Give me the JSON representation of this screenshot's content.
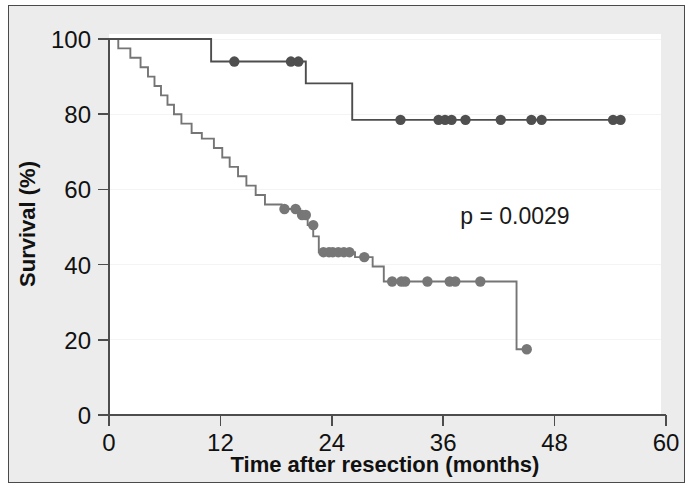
{
  "figure": {
    "background_color": "#ececec",
    "plot_background_color": "#ffffff",
    "border_color": "#4a4a4a"
  },
  "annotations": {
    "pvalue": "p = 0.0029"
  },
  "axis": {
    "x_title": "Time after resection (months)",
    "y_title": "Survival (%)",
    "x_ticks": [
      "0",
      "12",
      "24",
      "36",
      "48",
      "60"
    ],
    "y_ticks": [
      "0",
      "20",
      "40",
      "60",
      "80",
      "100"
    ]
  },
  "chart_data": {
    "type": "line",
    "subtype": "kaplan-meier-survival",
    "title": "",
    "xlabel": "Time after resection (months)",
    "ylabel": "Survival (%)",
    "xlim": [
      0,
      60
    ],
    "ylim": [
      0,
      100
    ],
    "xticks": [
      0,
      12,
      24,
      36,
      48,
      60
    ],
    "yticks": [
      0,
      20,
      40,
      60,
      80,
      100
    ],
    "grid": true,
    "legend": "none",
    "annotations": [
      {
        "text": "p = 0.0029",
        "x": 41.5,
        "y": 54
      }
    ],
    "series": [
      {
        "name": "upper-curve",
        "color": "#4d4d4d",
        "steps": [
          {
            "x": 0.0,
            "y": 100.0
          },
          {
            "x": 11.0,
            "y": 100.0
          },
          {
            "x": 11.0,
            "y": 94.0
          },
          {
            "x": 21.2,
            "y": 94.0
          },
          {
            "x": 21.2,
            "y": 88.2
          },
          {
            "x": 26.2,
            "y": 88.2
          },
          {
            "x": 26.2,
            "y": 78.5
          },
          {
            "x": 55.2,
            "y": 78.5
          }
        ],
        "censored": [
          {
            "x": 13.5,
            "y": 94.0
          },
          {
            "x": 19.6,
            "y": 94.0
          },
          {
            "x": 20.4,
            "y": 94.0
          },
          {
            "x": 31.4,
            "y": 78.5
          },
          {
            "x": 35.5,
            "y": 78.5
          },
          {
            "x": 36.2,
            "y": 78.5
          },
          {
            "x": 36.9,
            "y": 78.5
          },
          {
            "x": 38.4,
            "y": 78.5
          },
          {
            "x": 42.2,
            "y": 78.5
          },
          {
            "x": 45.5,
            "y": 78.5
          },
          {
            "x": 46.6,
            "y": 78.5
          },
          {
            "x": 54.3,
            "y": 78.5
          },
          {
            "x": 55.1,
            "y": 78.5
          }
        ]
      },
      {
        "name": "lower-curve",
        "color": "#757575",
        "steps": [
          {
            "x": 0.0,
            "y": 100.0
          },
          {
            "x": 1.0,
            "y": 100.0
          },
          {
            "x": 1.0,
            "y": 97.5
          },
          {
            "x": 2.3,
            "y": 97.5
          },
          {
            "x": 2.3,
            "y": 95.0
          },
          {
            "x": 3.4,
            "y": 95.0
          },
          {
            "x": 3.4,
            "y": 92.5
          },
          {
            "x": 4.2,
            "y": 92.5
          },
          {
            "x": 4.2,
            "y": 90.0
          },
          {
            "x": 4.9,
            "y": 90.0
          },
          {
            "x": 4.9,
            "y": 87.5
          },
          {
            "x": 5.6,
            "y": 87.5
          },
          {
            "x": 5.6,
            "y": 85.0
          },
          {
            "x": 6.3,
            "y": 85.0
          },
          {
            "x": 6.3,
            "y": 82.5
          },
          {
            "x": 7.0,
            "y": 82.5
          },
          {
            "x": 7.0,
            "y": 80.0
          },
          {
            "x": 7.8,
            "y": 80.0
          },
          {
            "x": 7.8,
            "y": 77.5
          },
          {
            "x": 8.9,
            "y": 77.5
          },
          {
            "x": 8.9,
            "y": 75.0
          },
          {
            "x": 10.0,
            "y": 75.0
          },
          {
            "x": 10.0,
            "y": 73.5
          },
          {
            "x": 11.3,
            "y": 73.5
          },
          {
            "x": 11.3,
            "y": 71.0
          },
          {
            "x": 12.2,
            "y": 71.0
          },
          {
            "x": 12.2,
            "y": 68.5
          },
          {
            "x": 13.0,
            "y": 68.5
          },
          {
            "x": 13.0,
            "y": 66.0
          },
          {
            "x": 13.9,
            "y": 66.0
          },
          {
            "x": 13.9,
            "y": 63.5
          },
          {
            "x": 14.8,
            "y": 63.5
          },
          {
            "x": 14.8,
            "y": 61.0
          },
          {
            "x": 15.8,
            "y": 61.0
          },
          {
            "x": 15.8,
            "y": 58.5
          },
          {
            "x": 16.8,
            "y": 58.5
          },
          {
            "x": 16.8,
            "y": 56.0
          },
          {
            "x": 18.6,
            "y": 56.0
          },
          {
            "x": 18.6,
            "y": 54.8
          },
          {
            "x": 20.6,
            "y": 54.8
          },
          {
            "x": 20.6,
            "y": 53.2
          },
          {
            "x": 21.4,
            "y": 53.2
          },
          {
            "x": 21.4,
            "y": 50.5
          },
          {
            "x": 22.0,
            "y": 50.5
          },
          {
            "x": 22.0,
            "y": 47.5
          },
          {
            "x": 22.6,
            "y": 47.5
          },
          {
            "x": 22.6,
            "y": 43.3
          },
          {
            "x": 26.5,
            "y": 43.3
          },
          {
            "x": 26.5,
            "y": 42.0
          },
          {
            "x": 28.4,
            "y": 42.0
          },
          {
            "x": 28.4,
            "y": 39.5
          },
          {
            "x": 29.6,
            "y": 39.5
          },
          {
            "x": 29.6,
            "y": 35.5
          },
          {
            "x": 43.9,
            "y": 35.5
          },
          {
            "x": 43.9,
            "y": 17.5
          },
          {
            "x": 45.0,
            "y": 17.5
          }
        ],
        "censored": [
          {
            "x": 18.9,
            "y": 54.8
          },
          {
            "x": 20.1,
            "y": 54.8
          },
          {
            "x": 20.8,
            "y": 53.2
          },
          {
            "x": 21.2,
            "y": 53.2
          },
          {
            "x": 22.0,
            "y": 50.5
          },
          {
            "x": 23.1,
            "y": 43.3
          },
          {
            "x": 23.7,
            "y": 43.3
          },
          {
            "x": 24.1,
            "y": 43.3
          },
          {
            "x": 24.7,
            "y": 43.3
          },
          {
            "x": 25.3,
            "y": 43.3
          },
          {
            "x": 25.9,
            "y": 43.3
          },
          {
            "x": 27.5,
            "y": 42.0
          },
          {
            "x": 30.5,
            "y": 35.5
          },
          {
            "x": 31.5,
            "y": 35.5
          },
          {
            "x": 31.9,
            "y": 35.5
          },
          {
            "x": 34.3,
            "y": 35.5
          },
          {
            "x": 36.7,
            "y": 35.5
          },
          {
            "x": 37.3,
            "y": 35.5
          },
          {
            "x": 40.0,
            "y": 35.5
          },
          {
            "x": 45.0,
            "y": 17.5
          }
        ]
      }
    ]
  }
}
